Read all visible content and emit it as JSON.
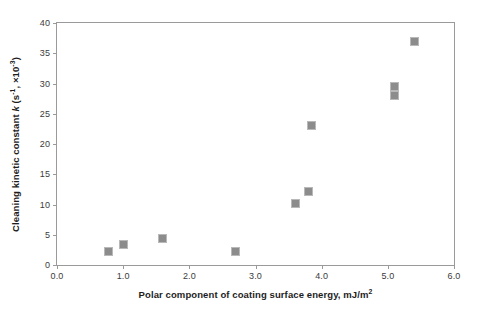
{
  "chart_data": {
    "type": "scatter",
    "title": "",
    "xlabel": "Polar component of coating surface energy, mJ/m²",
    "ylabel": "Cleaning kinetic constant k (s⁻¹, ×10⁻³)",
    "ylabel_parts": {
      "prefix": "Cleaning kinetic constant ",
      "italic_k": "k",
      "open": " (s",
      "sup1": "-1",
      "mid": ", ×10",
      "sup2": "-3",
      "close": ")"
    },
    "xlabel_parts": {
      "text": "Polar component of coating surface energy, mJ/m",
      "sup": "2"
    },
    "xlim": [
      0.0,
      6.0
    ],
    "ylim": [
      0,
      40
    ],
    "xticks": [
      "0.0",
      "1.0",
      "2.0",
      "3.0",
      "4.0",
      "5.0",
      "6.0"
    ],
    "xtick_values": [
      0.0,
      1.0,
      2.0,
      3.0,
      4.0,
      5.0,
      6.0
    ],
    "yticks": [
      "0",
      "5",
      "10",
      "15",
      "20",
      "25",
      "30",
      "35",
      "40"
    ],
    "ytick_values": [
      0,
      5,
      10,
      15,
      20,
      25,
      30,
      35,
      40
    ],
    "grid": false,
    "legend": null,
    "marker_color": "#8c8c8c",
    "marker_edge_color": "#b9b9b9",
    "marker_shape": "square",
    "axis_color": "#9a9a9a",
    "points": [
      {
        "x": 0.78,
        "y": 2.3
      },
      {
        "x": 1.0,
        "y": 3.4
      },
      {
        "x": 1.6,
        "y": 4.3
      },
      {
        "x": 2.7,
        "y": 2.2
      },
      {
        "x": 3.6,
        "y": 10.2
      },
      {
        "x": 3.8,
        "y": 12.2
      },
      {
        "x": 3.85,
        "y": 23.0
      },
      {
        "x": 5.1,
        "y": 29.5
      },
      {
        "x": 5.1,
        "y": 28.0
      },
      {
        "x": 5.4,
        "y": 37.0
      }
    ]
  }
}
